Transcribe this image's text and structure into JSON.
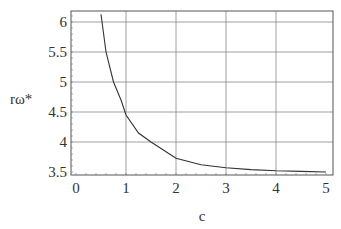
{
  "chart_data": {
    "type": "line",
    "title": "",
    "xlabel": "c",
    "ylabel": "rω*",
    "xlim": [
      0,
      5
    ],
    "ylim": [
      3.5,
      6.15
    ],
    "grid": true,
    "xticks": [
      "0",
      "1",
      "2",
      "3",
      "4",
      "5"
    ],
    "yticks": [
      "3.5",
      "4",
      "4.5",
      "5",
      "5.5",
      "6"
    ],
    "series": [
      {
        "name": "rω*",
        "x": [
          0.5,
          0.6,
          0.75,
          0.9,
          1.0,
          1.25,
          1.5,
          2.0,
          2.5,
          3.0,
          3.5,
          4.0,
          4.5,
          5.0
        ],
        "y": [
          6.13,
          5.5,
          5.0,
          4.7,
          4.45,
          4.15,
          4.0,
          3.73,
          3.62,
          3.57,
          3.54,
          3.52,
          3.51,
          3.5
        ]
      }
    ]
  }
}
